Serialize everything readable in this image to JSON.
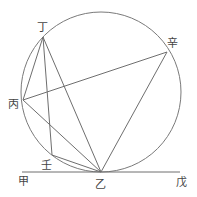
{
  "diagram": {
    "circle": {
      "cx": 101,
      "cy": 92,
      "r": 80,
      "stroke": "#7a7a7a"
    },
    "baseline": {
      "from": "甲",
      "to": "戊",
      "y": 172,
      "x1": 22,
      "x2": 180
    },
    "points": {
      "ding": {
        "label": "丁",
        "x": 43,
        "y": 37,
        "lx": 42,
        "ly": 27
      },
      "bing": {
        "label": "丙",
        "x": 23,
        "y": 100,
        "lx": 13,
        "ly": 104
      },
      "ren": {
        "label": "壬",
        "x": 52,
        "y": 155,
        "lx": 46,
        "ly": 165
      },
      "yi": {
        "label": "乙",
        "x": 101,
        "y": 172,
        "lx": 100,
        "ly": 184
      },
      "xin": {
        "label": "辛",
        "x": 167,
        "y": 52,
        "lx": 172,
        "ly": 43
      },
      "jia": {
        "label": "甲",
        "lx": 23,
        "ly": 181
      },
      "wu": {
        "label": "戊",
        "lx": 181,
        "ly": 182
      }
    },
    "segments": [
      [
        "丁",
        "丙"
      ],
      [
        "丁",
        "壬"
      ],
      [
        "丁",
        "乙"
      ],
      [
        "丙",
        "辛"
      ],
      [
        "丙",
        "乙"
      ],
      [
        "壬",
        "乙"
      ],
      [
        "辛",
        "乙"
      ]
    ],
    "line_color": "#6e6e6e"
  }
}
